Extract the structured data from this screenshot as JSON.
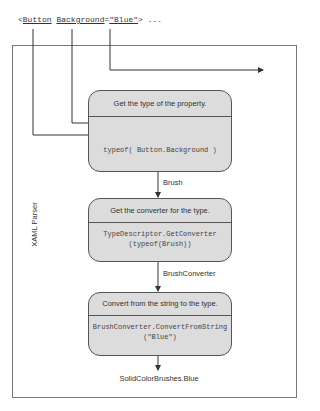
{
  "xaml_source": {
    "open": "<",
    "element": "Button",
    "attribute": "Background",
    "equals": "=",
    "value": "\"Blue\"",
    "close": "> ..."
  },
  "container": {
    "label": "XAML Parser"
  },
  "steps": [
    {
      "title": "Get the type of the property.",
      "code": "typeof( Button.Background )",
      "output": "Brush"
    },
    {
      "title": "Get the converter for the type.",
      "code_line1": "TypeDescriptor.GetConverter",
      "code_line2": "(typeof(Brush))",
      "output": "BrushConverter"
    },
    {
      "title": "Convert from the string to the type.",
      "code_line1": "BrushConverter.ConvertFromString",
      "code_line2": "(\"Blue\")",
      "output": "SolidColorBrushes.Blue"
    }
  ],
  "colors": {
    "box_fill": "#dcdcdc",
    "line": "#444444",
    "border": "#777777"
  }
}
